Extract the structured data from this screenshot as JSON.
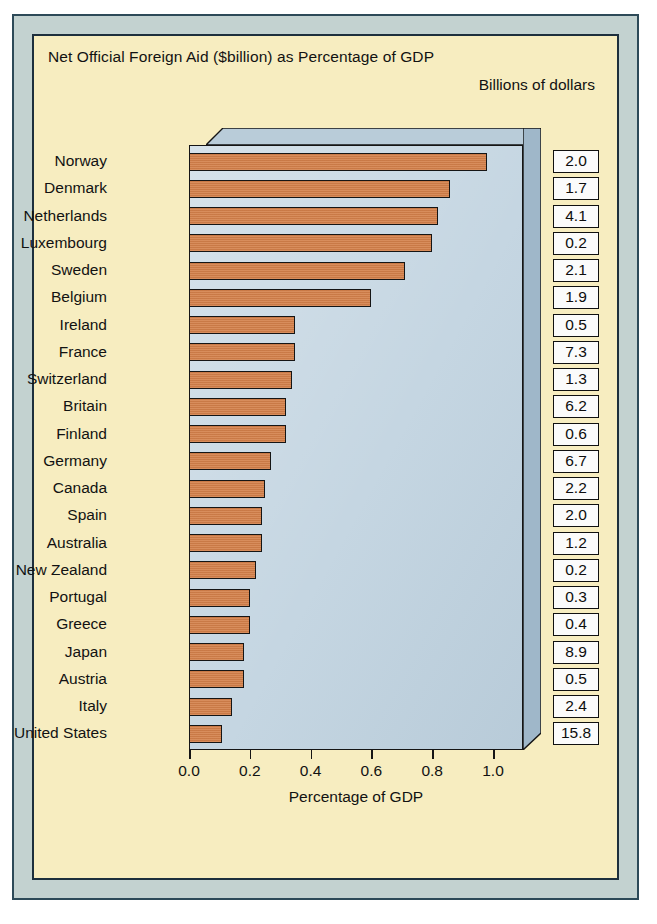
{
  "figure": {
    "title": "Net Official Foreign Aid ($billion) as Percentage of GDP",
    "subtitle": "Billions of dollars",
    "axis_title": "Percentage of GDP",
    "frame_color": "#c3d2d0",
    "panel_color": "#f7edc0",
    "plot_color": "#c5d6e2",
    "bar_color": "#d4804a",
    "border_color": "#151515"
  },
  "chart_data": {
    "type": "bar",
    "orientation": "horizontal",
    "title": "Net Official Foreign Aid ($billion) as Percentage of GDP",
    "subtitle": "Billions of dollars",
    "xlabel": "Percentage of GDP",
    "ylabel": "",
    "xlim": [
      0.0,
      1.0
    ],
    "grid": false,
    "legend": null,
    "xticks": [
      "0.0",
      "0.2",
      "0.4",
      "0.6",
      "0.8",
      "1.0"
    ],
    "xtick_values": [
      0.0,
      0.2,
      0.4,
      0.6,
      0.8,
      1.0
    ],
    "categories": [
      "Norway",
      "Denmark",
      "Netherlands",
      "Luxembourg",
      "Sweden",
      "Belgium",
      "Ireland",
      "France",
      "Switzerland",
      "Britain",
      "Finland",
      "Germany",
      "Canada",
      "Spain",
      "Australia",
      "New Zealand",
      "Portugal",
      "Greece",
      "Japan",
      "Austria",
      "Italy",
      "United States"
    ],
    "values": [
      0.98,
      0.86,
      0.82,
      0.8,
      0.71,
      0.6,
      0.35,
      0.35,
      0.34,
      0.32,
      0.32,
      0.27,
      0.25,
      0.24,
      0.24,
      0.22,
      0.2,
      0.2,
      0.18,
      0.18,
      0.14,
      0.11
    ],
    "annotations": {
      "name": "Billions of dollars",
      "labels": [
        "2.0",
        "1.7",
        "4.1",
        "0.2",
        "2.1",
        "1.9",
        "0.5",
        "7.3",
        "1.3",
        "6.2",
        "0.6",
        "6.7",
        "2.2",
        "2.0",
        "1.2",
        "0.2",
        "0.3",
        "0.4",
        "8.9",
        "0.5",
        "2.4",
        "15.8"
      ]
    }
  }
}
